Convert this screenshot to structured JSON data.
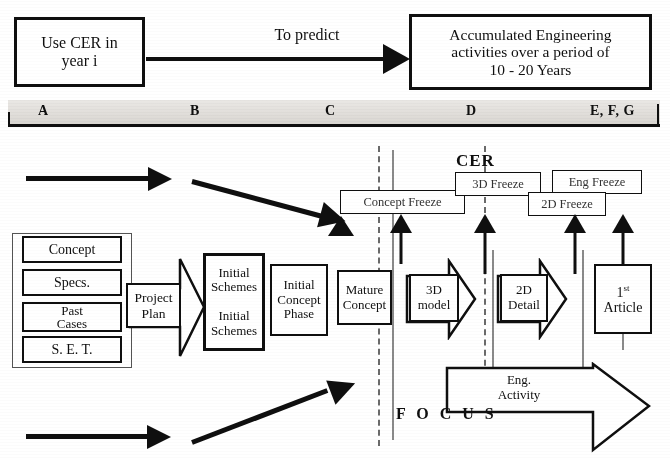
{
  "diagram": {
    "top_flow": {
      "source_box": "Use CER in\nyear i",
      "source_line1": "Use CER in",
      "source_line2": "year i",
      "arrow_label": "To predict",
      "target_line1": "Accumulated Engineering",
      "target_line2": "activities over a period of",
      "target_line3": "10 - 20 Years"
    },
    "phase_band": {
      "letters": [
        {
          "label": "A",
          "x": 45
        },
        {
          "label": "B",
          "x": 196
        },
        {
          "label": "C",
          "x": 330
        },
        {
          "label": "D",
          "x": 470
        },
        {
          "label": "E, F, G",
          "x": 594
        }
      ]
    },
    "inputs": [
      {
        "label": "Concept"
      },
      {
        "label": "Specs."
      },
      {
        "label": "Past\nCases"
      },
      {
        "label": "S. E. T."
      }
    ],
    "input_labels": {
      "concept": "Concept",
      "specs": "Specs.",
      "past_cases_line1": "Past",
      "past_cases_line2": "Cases",
      "set": "S. E. T."
    },
    "process": {
      "project_plan_line1": "Project",
      "project_plan_line2": "Plan",
      "initial_schemes_line1": "Initial",
      "initial_schemes_line2": "Schemes",
      "initial_schemes_line3": "Initial",
      "initial_schemes_line4": "Schemes",
      "initial_concept_line1": "Initial",
      "initial_concept_line2": "Concept",
      "initial_concept_line3": "Phase",
      "mature_concept_line1": "Mature",
      "mature_concept_line2": "Concept",
      "model_3d_line1": "3D",
      "model_3d_line2": "model",
      "detail_2d_line1": "2D",
      "detail_2d_line2": "Detail",
      "first_article_line1": "1",
      "first_article_sup": "st",
      "first_article_line2": "Article",
      "eng_activity_line1": "Eng.",
      "eng_activity_line2": "Activity"
    },
    "cer": {
      "heading": "CER",
      "focus_heading": "F O C U S",
      "concept_freeze": "Concept Freeze",
      "freeze_3d": "3D Freeze",
      "freeze_2d": "2D Freeze",
      "eng_freeze": "Eng Freeze"
    },
    "colors": {
      "ink": "#111111",
      "band": "#dedbd7",
      "dashed_guide": "#6a6a6a",
      "paper": "#fefefe"
    }
  }
}
